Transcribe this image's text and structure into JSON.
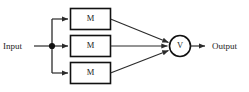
{
  "diagram": {
    "background_color": "#ffffff",
    "line_color": "#2b2b2b",
    "stroke_color": "#111111",
    "text_color": "#242424",
    "input": {
      "label": "Input"
    },
    "output": {
      "label": "Output"
    },
    "junction": {
      "name": "fan-out-node"
    },
    "modules": [
      {
        "label": "M",
        "position": "top"
      },
      {
        "label": "M",
        "position": "middle"
      },
      {
        "label": "M",
        "position": "bottom"
      }
    ],
    "voter": {
      "label": "V"
    }
  }
}
